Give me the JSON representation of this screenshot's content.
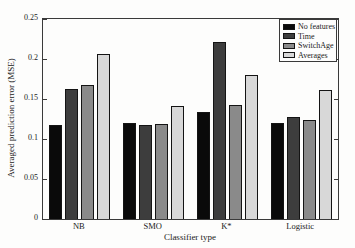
{
  "chart_data": {
    "type": "bar",
    "title": "",
    "xlabel": "Classifier type",
    "ylabel": "Averaged prediction error (MSE)",
    "categories": [
      "NB",
      "SMO",
      "K*",
      "Logistic"
    ],
    "series": [
      {
        "name": "No features",
        "color": "#0a0a0a",
        "values": [
          0.118,
          0.12,
          0.134,
          0.12
        ]
      },
      {
        "name": "Time",
        "color": "#3d3d3d",
        "values": [
          0.162,
          0.117,
          0.221,
          0.128
        ]
      },
      {
        "name": "SwitchAge",
        "color": "#8a8a8a",
        "values": [
          0.168,
          0.119,
          0.143,
          0.124
        ]
      },
      {
        "name": "Averages",
        "color": "#d8d8d8",
        "values": [
          0.206,
          0.141,
          0.18,
          0.161
        ]
      }
    ],
    "ylim": [
      0,
      0.25
    ],
    "yticks": [
      0,
      0.05,
      0.1,
      0.15,
      0.2,
      0.25
    ],
    "ytick_labels": [
      "0",
      "0.05",
      "0.1",
      "0.15",
      "0.2",
      "0.25"
    ],
    "grid": false,
    "legend_position": "top-right-inside"
  }
}
